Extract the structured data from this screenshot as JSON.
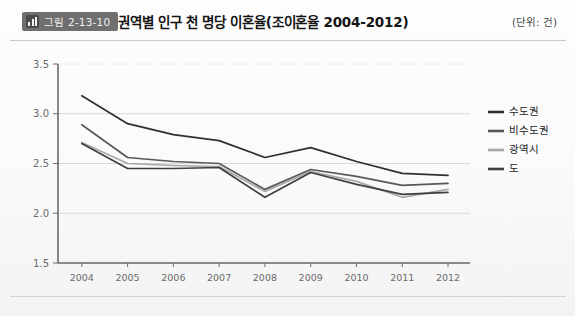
{
  "header": {
    "badge_label": "그림 2-13-10",
    "badge_icon": "bar-chart-icon",
    "title": "권역별 인구 천 명당 이혼율(조이혼율 2004-2012)",
    "unit_note": "(단위: 건)"
  },
  "colors": {
    "sudogwon": "#2f2f2f",
    "bisudogwon": "#585858",
    "gwangyeoksi": "#a8a8a8",
    "do": "#3f3f3f",
    "axis": "#6b6b6b",
    "grid": "#d8d8d8",
    "badge_bg": "#6f6f6f"
  },
  "chart_data": {
    "type": "line",
    "title": "권역별 인구 천 명당 이혼율(조이혼율 2004-2012)",
    "xlabel": "",
    "ylabel": "",
    "unit": "건",
    "ylim": [
      1.5,
      3.5
    ],
    "yticks": [
      "1.5",
      "2.0",
      "2.5",
      "3.0",
      "3.5"
    ],
    "ytick_values": [
      1.5,
      2.0,
      2.5,
      3.0,
      3.5
    ],
    "grid": true,
    "legend_position": "right",
    "categories": [
      "2004",
      "2005",
      "2006",
      "2007",
      "2008",
      "2009",
      "2010",
      "2011",
      "2012"
    ],
    "series": [
      {
        "name": "수도권",
        "color": "#2f2f2f",
        "values": [
          3.18,
          2.9,
          2.79,
          2.73,
          2.56,
          2.66,
          2.52,
          2.4,
          2.38
        ]
      },
      {
        "name": "비수도권",
        "color": "#585858",
        "values": [
          2.89,
          2.56,
          2.52,
          2.5,
          2.24,
          2.44,
          2.37,
          2.28,
          2.3
        ]
      },
      {
        "name": "광역시",
        "color": "#a8a8a8",
        "values": [
          2.71,
          2.5,
          2.48,
          2.47,
          2.22,
          2.42,
          2.32,
          2.16,
          2.24
        ]
      },
      {
        "name": "도",
        "color": "#3f3f3f",
        "values": [
          2.7,
          2.45,
          2.45,
          2.46,
          2.16,
          2.41,
          2.29,
          2.19,
          2.21
        ]
      }
    ]
  }
}
